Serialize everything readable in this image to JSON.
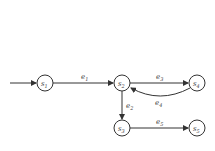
{
  "diagram": {
    "type": "state-transition-graph",
    "colors": {
      "stroke": "#333333",
      "text": "#444444",
      "background": "#ffffff"
    },
    "nodes": [
      {
        "id": "s1",
        "base": "s",
        "sub": "1",
        "x": 45,
        "y": 83
      },
      {
        "id": "s2",
        "base": "s",
        "sub": "2",
        "x": 122,
        "y": 83
      },
      {
        "id": "s3",
        "base": "s",
        "sub": "3",
        "x": 122,
        "y": 128
      },
      {
        "id": "s4",
        "base": "s",
        "sub": "4",
        "x": 197,
        "y": 83
      },
      {
        "id": "s5",
        "base": "s",
        "sub": "5",
        "x": 197,
        "y": 128
      }
    ],
    "edges": [
      {
        "id": "e1",
        "base": "e",
        "sub": "1",
        "from": "s1",
        "to": "s2",
        "lx": 83,
        "ly": 78
      },
      {
        "id": "e2",
        "base": "e",
        "sub": "2",
        "from": "s2",
        "to": "s3",
        "lx": 127,
        "ly": 108
      },
      {
        "id": "e3",
        "base": "e",
        "sub": "3",
        "from": "s2",
        "to": "s4",
        "lx": 160,
        "ly": 78
      },
      {
        "id": "e4",
        "base": "e",
        "sub": "4",
        "from": "s4",
        "to": "s2",
        "lx": 158,
        "ly": 104
      },
      {
        "id": "e5",
        "base": "e",
        "sub": "5",
        "from": "s3",
        "to": "s5",
        "lx": 160,
        "ly": 123
      }
    ],
    "initial": {
      "to": "s1"
    }
  }
}
